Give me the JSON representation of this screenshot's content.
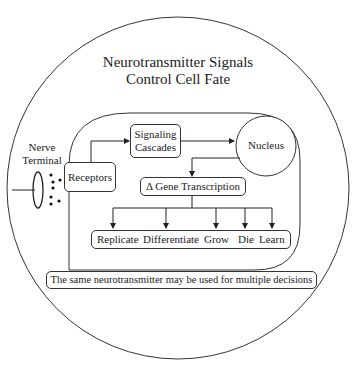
{
  "title": {
    "line1": "Neurotransmitter Signals",
    "line2": "Control Cell Fate"
  },
  "nerve_terminal": {
    "line1": "Nerve",
    "line2": "Terminal"
  },
  "nodes": {
    "receptors": "Receptors",
    "signaling_line1": "Signaling",
    "signaling_line2": "Cascades",
    "nucleus": "Nucleus",
    "gene_transcription": "Δ Gene Transcription"
  },
  "outcomes": [
    "Replicate",
    "Differentiate",
    "Grow",
    "Die",
    "Learn"
  ],
  "note": "The same neurotransmitter may be used for multiple decisions"
}
